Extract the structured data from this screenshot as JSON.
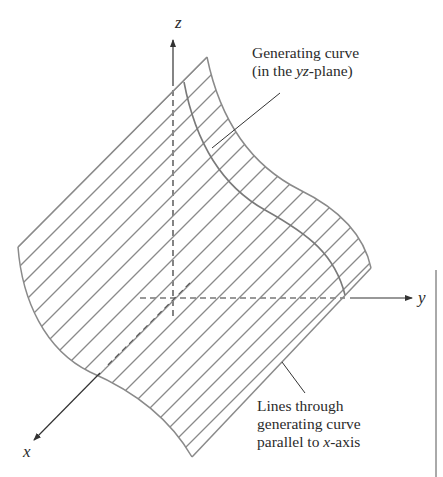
{
  "diagram": {
    "type": "3d-cylindrical-surface",
    "axes": {
      "x_label": "x",
      "y_label": "y",
      "z_label": "z"
    },
    "annotations": {
      "generating_curve": {
        "line1": "Generating curve",
        "line2_prefix": "(in the ",
        "line2_italic": "yz",
        "line2_suffix": "-plane)"
      },
      "rulings": {
        "line1": "Lines through",
        "line2": "generating curve",
        "line3_prefix": "parallel to ",
        "line3_italic": "x",
        "line3_suffix": "-axis"
      }
    },
    "colors": {
      "surface_stroke": "#8a8a8a",
      "axis_stroke": "#333333",
      "text": "#2b2b2b",
      "background": "#ffffff"
    }
  }
}
